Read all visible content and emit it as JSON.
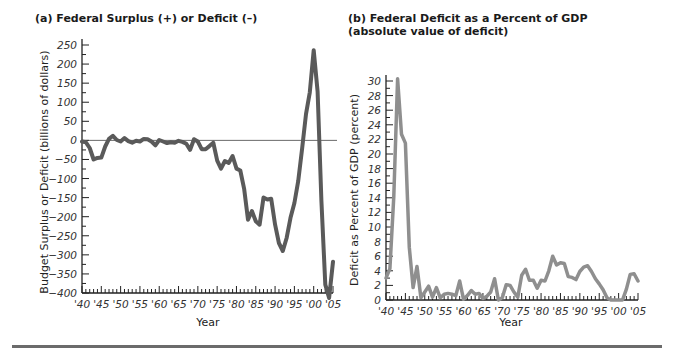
{
  "chart_data": [
    {
      "type": "line",
      "title": "(a) Federal Surplus (+) or Deficit (–)",
      "xlabel": "Year",
      "ylabel": "Budget Surplus or Deficit (billions of dollars)",
      "ylim": [
        -400,
        250
      ],
      "yticks": [
        250,
        200,
        150,
        100,
        50,
        0,
        -50,
        -100,
        -150,
        -200,
        -250,
        -300,
        -350,
        -400
      ],
      "xticks": [
        "'40",
        "'45",
        "'50",
        "'55",
        "'60",
        "'65",
        "'70",
        "'75",
        "'80",
        "'85",
        "'90",
        "'95",
        "'00",
        "'05"
      ],
      "grid": false,
      "reference_line": 0,
      "line_color": "#5a5a5a",
      "series": [
        {
          "name": "Federal Surplus or Deficit",
          "x": [
            1940,
            1941,
            1942,
            1943,
            1944,
            1945,
            1946,
            1947,
            1948,
            1949,
            1950,
            1951,
            1952,
            1953,
            1954,
            1955,
            1956,
            1957,
            1958,
            1959,
            1960,
            1961,
            1962,
            1963,
            1964,
            1965,
            1966,
            1967,
            1968,
            1969,
            1970,
            1971,
            1972,
            1973,
            1974,
            1975,
            1976,
            1977,
            1978,
            1979,
            1980,
            1981,
            1982,
            1983,
            1984,
            1985,
            1986,
            1987,
            1988,
            1989,
            1990,
            1991,
            1992,
            1993,
            1994,
            1995,
            1996,
            1997,
            1998,
            1999,
            2000,
            2001,
            2002,
            2003,
            2004,
            2005
          ],
          "values": [
            -3,
            -5,
            -20,
            -50,
            -46,
            -45,
            -16,
            4,
            12,
            1,
            -3,
            6,
            -2,
            -6,
            -1,
            -3,
            4,
            3,
            -3,
            -13,
            1,
            -3,
            -7,
            -5,
            -6,
            -1,
            -4,
            -9,
            -25,
            3,
            -3,
            -23,
            -23,
            -15,
            -6,
            -53,
            -74,
            -54,
            -59,
            -41,
            -74,
            -79,
            -128,
            -208,
            -185,
            -212,
            -221,
            -150,
            -155,
            -153,
            -221,
            -269,
            -290,
            -255,
            -203,
            -164,
            -107,
            -22,
            69,
            126,
            236,
            128,
            -158,
            -378,
            -413,
            -318
          ]
        }
      ]
    },
    {
      "type": "line",
      "title": "(b) Federal Deficit as a Percent of GDP (absolute value of deficit)",
      "xlabel": "Year",
      "ylabel": "Deficit as Percent of GDP (percent)",
      "ylim": [
        0,
        30
      ],
      "yticks": [
        30,
        28,
        26,
        24,
        22,
        20,
        18,
        16,
        14,
        12,
        10,
        8,
        6,
        4,
        2,
        0
      ],
      "xticks": [
        "'40",
        "'45",
        "'50",
        "'55",
        "'60",
        "'65",
        "'70",
        "'75",
        "'80",
        "'85",
        "'90",
        "'95",
        "'00",
        "'05"
      ],
      "grid": false,
      "line_color": "#8f8f8f",
      "series": [
        {
          "name": "Deficit as Percent of GDP",
          "x": [
            1940,
            1941,
            1942,
            1943,
            1944,
            1945,
            1946,
            1947,
            1948,
            1949,
            1950,
            1951,
            1952,
            1953,
            1954,
            1955,
            1956,
            1957,
            1958,
            1959,
            1960,
            1961,
            1962,
            1963,
            1964,
            1965,
            1966,
            1967,
            1968,
            1969,
            1970,
            1971,
            1972,
            1973,
            1974,
            1975,
            1976,
            1977,
            1978,
            1979,
            1980,
            1981,
            1982,
            1983,
            1984,
            1985,
            1986,
            1987,
            1988,
            1989,
            1990,
            1991,
            1992,
            1993,
            1994,
            1995,
            1996,
            1997,
            1998,
            1999,
            2000,
            2001,
            2002,
            2003,
            2004,
            2005
          ],
          "values": [
            3.0,
            4.3,
            14.2,
            30.3,
            22.7,
            21.5,
            7.2,
            1.7,
            4.6,
            0.3,
            1.1,
            1.9,
            0.4,
            1.7,
            0.3,
            0.8,
            0.9,
            0.8,
            0.6,
            2.6,
            0.1,
            0.6,
            1.3,
            0.8,
            0.9,
            0.2,
            0.5,
            1.1,
            2.9,
            0.0,
            0.3,
            2.1,
            2.0,
            1.1,
            0.4,
            3.4,
            4.2,
            2.7,
            2.7,
            1.6,
            2.7,
            2.6,
            4.0,
            6.0,
            4.8,
            5.1,
            5.0,
            3.2,
            3.1,
            2.8,
            3.9,
            4.5,
            4.7,
            3.9,
            2.9,
            2.2,
            1.4,
            0.3,
            0.0,
            0.0,
            0.0,
            0.0,
            1.5,
            3.5,
            3.6,
            2.6
          ]
        }
      ]
    }
  ],
  "panel_a": {
    "title": "(a) Federal Surplus (+) or Deficit (–)",
    "ylabel": "Budget Surplus or Deficit (billions of dollars)",
    "xlabel": "Year"
  },
  "panel_b": {
    "title_line1": "(b) Federal Deficit as a Percent of GDP",
    "title_line2": "(absolute value of deficit)",
    "ylabel": "Deficit as Percent of GDP (percent)",
    "xlabel": "Year"
  }
}
